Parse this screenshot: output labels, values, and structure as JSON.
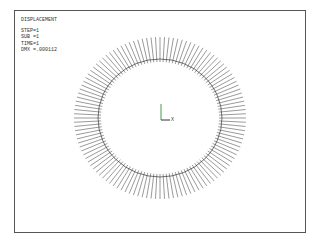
{
  "plot": {
    "title": "DISPLACEMENT",
    "step": "STEP=1",
    "sub": "SUB =1",
    "time": "TIME=1",
    "dmx": "DMX =.000112",
    "axis_label_x": "X"
  },
  "ring": {
    "center": [
      160,
      118
    ],
    "inner_radius_x": 59,
    "inner_radius_y": 56,
    "outer_radius_x": 86,
    "outer_radius_y": 81,
    "vector_count": 120,
    "vector_color": "#555555",
    "circle_color": "#333333"
  },
  "colors": {
    "y_axis": "#4a9a4a",
    "x_axis": "#333333",
    "frame": "#555555"
  }
}
